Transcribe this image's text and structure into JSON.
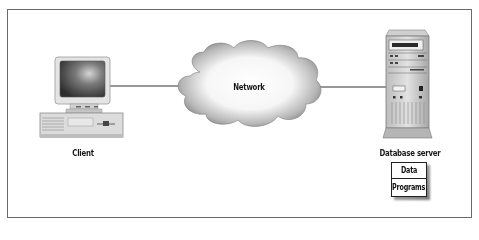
{
  "diagram": {
    "type": "client-server architecture",
    "nodes": [
      {
        "id": "client",
        "label": "Client",
        "icon": "desktop-computer-icon"
      },
      {
        "id": "network",
        "label": "Network",
        "icon": "cloud-icon"
      },
      {
        "id": "server",
        "label": "Database server",
        "icon": "server-tower-icon"
      }
    ],
    "edges": [
      {
        "from": "client",
        "to": "network"
      },
      {
        "from": "network",
        "to": "server"
      }
    ],
    "server_contents": {
      "items": [
        "Data",
        "Programs"
      ]
    }
  }
}
